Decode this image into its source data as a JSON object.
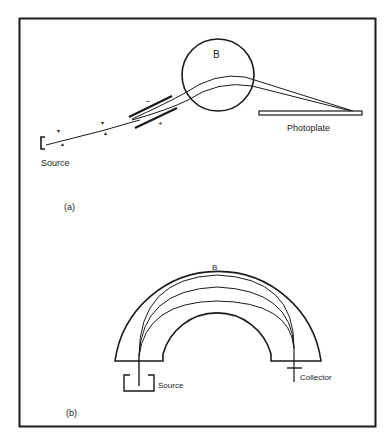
{
  "figure": {
    "panel_a": {
      "caption": "(a)",
      "magnet_label": "B",
      "source_label": "Source",
      "detector_label": "Photoplate",
      "plate_minus": "−",
      "plate_plus": "+"
    },
    "panel_b": {
      "caption": "(b)",
      "magnet_label": "B",
      "source_label": "Source",
      "detector_label": "Collector"
    },
    "colors": {
      "ink": "#1a1a1a",
      "background": "#ffffff"
    }
  }
}
